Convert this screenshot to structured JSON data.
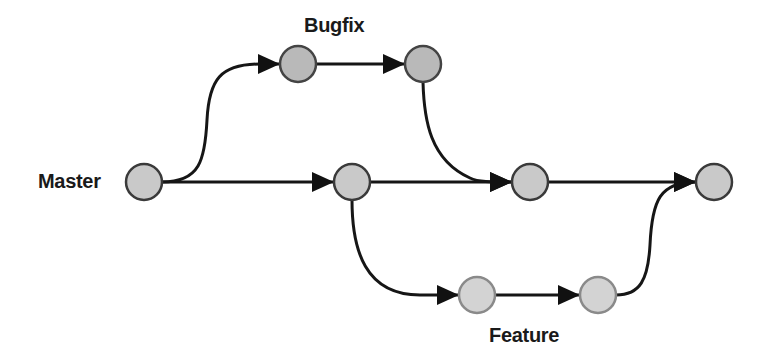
{
  "diagram": {
    "title": "",
    "branches": [
      {
        "name": "Master",
        "label": "Master",
        "fill": "#c9c9c9",
        "stroke": "#3a3a3a"
      },
      {
        "name": "Bugfix",
        "label": "Bugfix",
        "fill": "#b9b9b9",
        "stroke": "#444444"
      },
      {
        "name": "Feature",
        "label": "Feature",
        "fill": "#d3d3d3",
        "stroke": "#8a8a8a"
      }
    ],
    "nodes": [
      {
        "id": "m0",
        "branch": "Master",
        "x": 144,
        "y": 182
      },
      {
        "id": "m1",
        "branch": "Master",
        "x": 352,
        "y": 182
      },
      {
        "id": "m2",
        "branch": "Master",
        "x": 530,
        "y": 182
      },
      {
        "id": "m3",
        "branch": "Master",
        "x": 714,
        "y": 182
      },
      {
        "id": "b0",
        "branch": "Bugfix",
        "x": 298,
        "y": 64
      },
      {
        "id": "b1",
        "branch": "Bugfix",
        "x": 423,
        "y": 64
      },
      {
        "id": "f0",
        "branch": "Feature",
        "x": 477,
        "y": 295
      },
      {
        "id": "f1",
        "branch": "Feature",
        "x": 598,
        "y": 295
      }
    ],
    "edges": [
      {
        "from": "m0",
        "to": "m1",
        "type": "straight"
      },
      {
        "from": "m0",
        "to": "b0",
        "type": "branch-curve"
      },
      {
        "from": "b0",
        "to": "b1",
        "type": "straight"
      },
      {
        "from": "b1",
        "to": "m2",
        "type": "merge-curve"
      },
      {
        "from": "m1",
        "to": "m2",
        "type": "straight"
      },
      {
        "from": "m1",
        "to": "f0",
        "type": "branch-curve"
      },
      {
        "from": "f0",
        "to": "f1",
        "type": "straight"
      },
      {
        "from": "m2",
        "to": "m3",
        "type": "straight"
      },
      {
        "from": "f1",
        "to": "m3",
        "type": "merge-curve"
      }
    ],
    "labels": {
      "master": "Master",
      "bugfix": "Bugfix",
      "feature": "Feature"
    }
  }
}
